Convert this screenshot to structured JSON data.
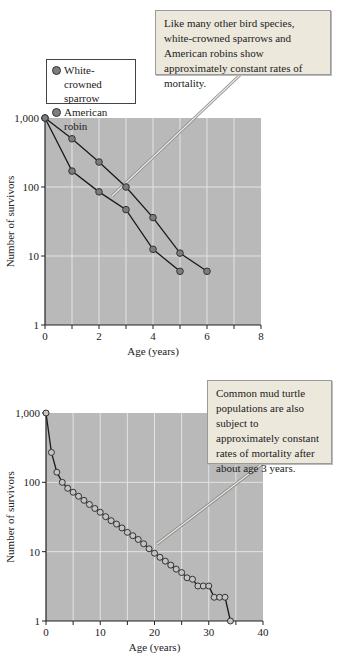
{
  "colors": {
    "plot_bg": "#b9b9b9",
    "grid": "#e4e4e4",
    "sparrow_marker": "#7d7d7d",
    "robin_marker": "#7d7d7d",
    "turtle_marker": "#c4c4c4",
    "callout_bg": "#ece8dc"
  },
  "top_chart": {
    "callout": "Like many other bird species, white-crowned sparrows and American robins show approximately constant rates of mortality.",
    "legend": [
      "White-crowned sparrow",
      "American robin"
    ]
  },
  "bottom_chart": {
    "callout": "Common mud turtle populations are also subject to approximately constant rates of mortality after about age 3 years."
  },
  "chart_data": [
    {
      "type": "line",
      "title": "",
      "xlabel": "Age (years)",
      "ylabel": "Number of survivors",
      "yscale": "log",
      "xlim": [
        0,
        8
      ],
      "ylim": [
        1,
        1000
      ],
      "xticks": [
        0,
        2,
        4,
        6,
        8
      ],
      "xticks_minor": [
        1,
        3,
        5,
        7
      ],
      "yticks": [
        1,
        10,
        100,
        1000
      ],
      "ytick_labels": [
        "1",
        "10",
        "100",
        "1,000"
      ],
      "grid": true,
      "legend_position": "upper left, above plot",
      "annotation": "Like many other bird species, white-crowned sparrows and American robins show approximately constant rates of mortality.",
      "series": [
        {
          "name": "White-crowned sparrow",
          "x": [
            0,
            1,
            2,
            3,
            4,
            5,
            6
          ],
          "values": [
            1000,
            500,
            230,
            100,
            36,
            11,
            6
          ]
        },
        {
          "name": "American robin",
          "x": [
            0,
            1,
            2,
            3,
            4,
            5
          ],
          "values": [
            1000,
            170,
            85,
            47,
            12.5,
            6
          ]
        }
      ]
    },
    {
      "type": "line",
      "title": "",
      "xlabel": "Age (years)",
      "ylabel": "Number of survivors",
      "yscale": "log",
      "xlim": [
        0,
        40
      ],
      "ylim": [
        1,
        1000
      ],
      "xticks": [
        0,
        10,
        20,
        30,
        40
      ],
      "xticks_minor": [
        5,
        15,
        25,
        35
      ],
      "yticks": [
        1,
        10,
        100,
        1000
      ],
      "ytick_labels": [
        "1",
        "10",
        "100",
        "1,000"
      ],
      "grid": true,
      "annotation": "Common mud turtle populations are also subject to approximately constant rates of mortality after about age 3 years.",
      "series": [
        {
          "name": "Common mud turtle",
          "x": [
            0,
            1,
            2,
            3,
            4,
            5,
            6,
            7,
            8,
            9,
            10,
            11,
            12,
            13,
            14,
            15,
            16,
            17,
            18,
            19,
            20,
            21,
            22,
            23,
            24,
            25,
            26,
            27,
            28,
            29,
            30,
            31,
            32,
            33,
            34
          ],
          "values": [
            1000,
            270,
            140,
            100,
            82,
            72,
            63,
            55,
            48,
            42,
            37,
            32,
            28,
            25,
            22,
            19,
            17,
            15,
            13,
            11,
            9.5,
            8.3,
            7.3,
            6.4,
            5.6,
            5,
            4.2,
            4,
            3.2,
            3.2,
            3.2,
            2.2,
            2.2,
            2.2,
            1
          ]
        }
      ]
    }
  ]
}
